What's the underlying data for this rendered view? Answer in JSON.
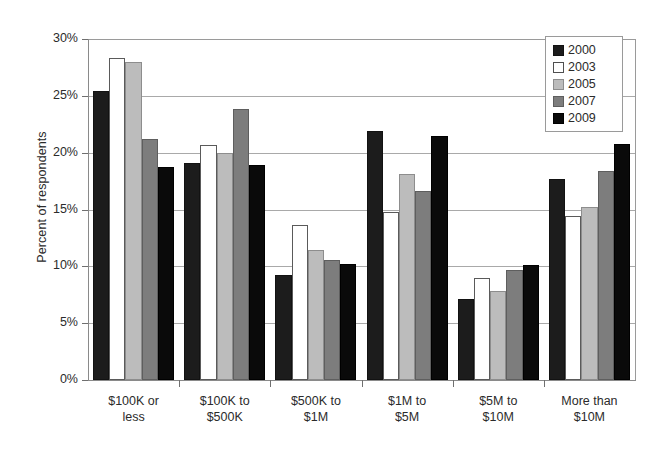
{
  "chart_data": {
    "type": "bar",
    "title": "",
    "xlabel": "",
    "ylabel": "Percent of respondents",
    "ylim": [
      0,
      30
    ],
    "ytick_labels": [
      "0%",
      "5%",
      "10%",
      "15%",
      "20%",
      "25%",
      "30%"
    ],
    "ytick_values": [
      0,
      5,
      10,
      15,
      20,
      25,
      30
    ],
    "grid": true,
    "legend_position": "top-right",
    "categories": [
      "$100K or less",
      "$100K to $500K",
      "$500K to $1M",
      "$1M to $5M",
      "$5M to $10M",
      "More than $10M"
    ],
    "category_lines": [
      [
        "$100K or",
        "less"
      ],
      [
        "$100K to",
        "$500K"
      ],
      [
        "$500K to",
        "$1M"
      ],
      [
        "$1M to",
        "$5M"
      ],
      [
        "$5M to",
        "$10M"
      ],
      [
        "More than",
        "$10M"
      ]
    ],
    "series": [
      {
        "name": "2000",
        "color": "#1c1c1c",
        "values": [
          25.4,
          19.1,
          9.2,
          21.9,
          7.1,
          17.7
        ]
      },
      {
        "name": "2003",
        "color": "#ffffff",
        "values": [
          28.3,
          20.7,
          13.6,
          14.8,
          9.0,
          14.4
        ]
      },
      {
        "name": "2005",
        "color": "#bcbcbc",
        "values": [
          28.0,
          20.0,
          11.4,
          18.1,
          7.8,
          15.2
        ]
      },
      {
        "name": "2007",
        "color": "#7d7d7d",
        "values": [
          21.2,
          23.8,
          10.6,
          16.6,
          9.7,
          18.4
        ]
      },
      {
        "name": "2009",
        "color": "#0a0a0a",
        "values": [
          18.7,
          18.9,
          10.2,
          21.5,
          10.1,
          20.8
        ]
      }
    ]
  },
  "legend": {
    "entries": [
      {
        "label": "2000"
      },
      {
        "label": "2003"
      },
      {
        "label": "2005"
      },
      {
        "label": "2007"
      },
      {
        "label": "2009"
      }
    ]
  }
}
